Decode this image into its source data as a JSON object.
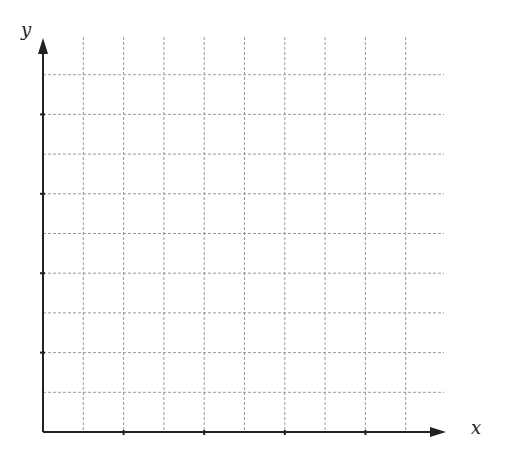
{
  "diagram": {
    "type": "blank coordinate grid",
    "x_axis_label": "x",
    "y_axis_label": "y",
    "grid_columns": 10,
    "grid_rows": 9,
    "x_ticks_every_gridlines": 2,
    "y_ticks_every_gridlines": 2,
    "colors": {
      "axis": "#222222",
      "grid": "#9a9a9a"
    }
  }
}
